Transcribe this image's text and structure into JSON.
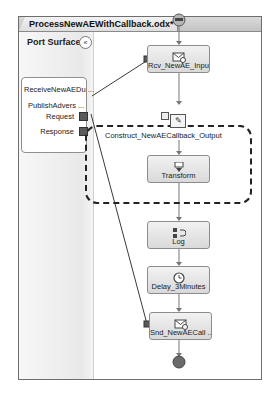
{
  "window": {
    "tab_title": "ProcessNewAEWithCallback.odx*"
  },
  "port_surface": {
    "title": "Port Surface",
    "collapse_glyph": "«",
    "port": {
      "name": "ReceiveNewAEDu ...",
      "operation": "PublishAdvers ...",
      "request": "Request",
      "response": "Response"
    }
  },
  "orchestration": {
    "shapes": [
      {
        "id": "rcv",
        "label": "Rcv_NewAE_Input",
        "icon": "receive-icon"
      },
      {
        "id": "transform",
        "label": "Transform",
        "icon": "transform-icon"
      },
      {
        "id": "log",
        "label": "Log",
        "icon": "expression-icon"
      },
      {
        "id": "delay",
        "label": "Delay_3Minutes",
        "icon": "clock-icon"
      },
      {
        "id": "snd",
        "label": "Snd_NewAECall ...",
        "icon": "send-icon"
      }
    ],
    "construct": {
      "label": "Construct_NewAECallback_Output"
    }
  },
  "colors": {
    "start_node": "#8a8a8a",
    "end_node": "#6a6a6a",
    "port_link": "#3a3a3a"
  }
}
